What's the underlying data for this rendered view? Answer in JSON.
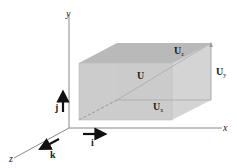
{
  "diagram": {
    "type": "3d-vector-components",
    "axes": {
      "x_label": "x",
      "y_label": "y",
      "z_label": "z"
    },
    "unit_vectors": {
      "i": "i",
      "j": "j",
      "k": "k"
    },
    "vector": {
      "label": "U",
      "components": {
        "x": {
          "main": "U",
          "sub": "x"
        },
        "y": {
          "main": "U",
          "sub": "y"
        },
        "z": {
          "main": "U",
          "sub": "z"
        }
      }
    },
    "colors": {
      "box_front": "#c8c8c8",
      "box_top": "#b4b4b4",
      "box_side": "#d6d6d6",
      "axis": "#777777",
      "text": "#222222"
    }
  }
}
